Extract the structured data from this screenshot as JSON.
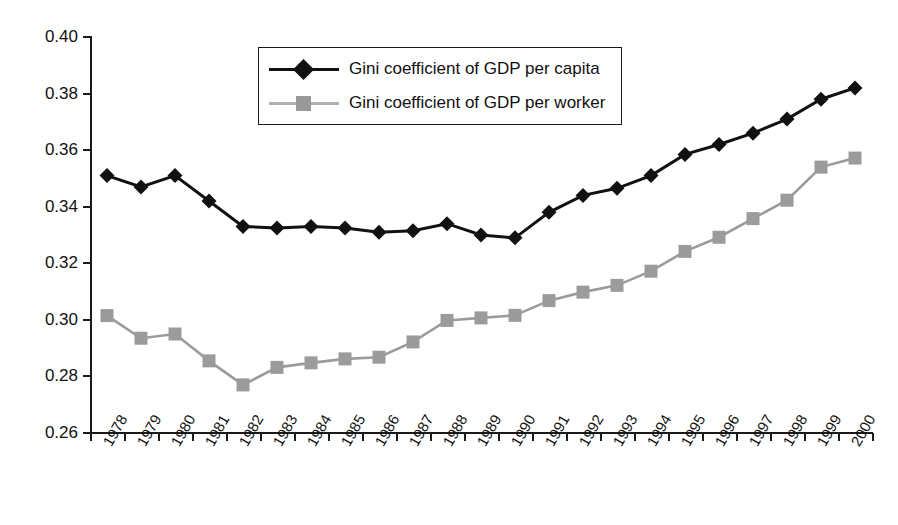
{
  "chart_data": {
    "type": "line",
    "title": "",
    "xlabel": "",
    "ylabel": "",
    "ylim": [
      0.26,
      0.4
    ],
    "ytick_step": 0.02,
    "grid": false,
    "legend_position": "top-center",
    "yticks": [
      "0.40",
      "0.38",
      "0.36",
      "0.34",
      "0.32",
      "0.30",
      "0.28",
      "0.26"
    ],
    "categories": [
      "1978",
      "1979",
      "1980",
      "1981",
      "1982",
      "1983",
      "1984",
      "1985",
      "1986",
      "1987",
      "1988",
      "1989",
      "1990",
      "1991",
      "1992",
      "1993",
      "1994",
      "1995",
      "1996",
      "1997",
      "1998",
      "1999",
      "2000"
    ],
    "series": [
      {
        "name": "Gini coefficient of GDP per capita",
        "marker": "diamond",
        "color": "#111111",
        "values": [
          0.351,
          0.347,
          0.351,
          0.342,
          0.333,
          0.3325,
          0.333,
          0.3325,
          0.331,
          0.3315,
          0.334,
          0.33,
          0.329,
          0.338,
          0.344,
          0.3465,
          0.351,
          0.3585,
          0.362,
          0.366,
          0.371,
          0.378,
          0.382
        ]
      },
      {
        "name": "Gini coefficient of GDP per worker",
        "marker": "square",
        "color": "#999999",
        "values": [
          0.3015,
          0.2935,
          0.295,
          0.2855,
          0.277,
          0.2832,
          0.2848,
          0.2862,
          0.2868,
          0.2922,
          0.2998,
          0.3007,
          0.3016,
          0.3068,
          0.3098,
          0.3122,
          0.3172,
          0.3242,
          0.3292,
          0.3358,
          0.3423,
          0.354,
          0.3572
        ]
      }
    ]
  },
  "legend": {
    "items": [
      {
        "label": "Gini coefficient of GDP per capita"
      },
      {
        "label": "Gini coefficient of GDP per worker"
      }
    ]
  }
}
